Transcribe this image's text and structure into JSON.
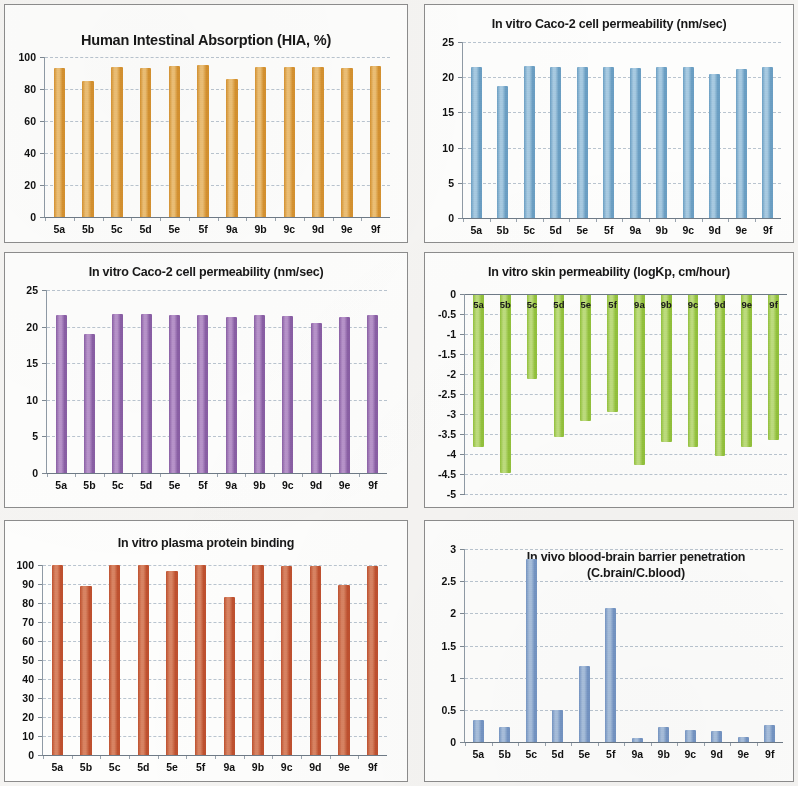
{
  "page": {
    "background": "#f5f4f2",
    "categories": [
      "5a",
      "5b",
      "5c",
      "5d",
      "5e",
      "5f",
      "9a",
      "9b",
      "9c",
      "9d",
      "9e",
      "9f"
    ]
  },
  "panels": [
    {
      "name": "panel-hia",
      "title": "Human Intestinal Absorption (HIA, %)",
      "title_size": "big"
    },
    {
      "name": "panel-caco2-blue",
      "title": "In vitro Caco-2 cell permeability (nm/sec)",
      "title_size": "mid"
    },
    {
      "name": "panel-caco2-purple",
      "title": "In vitro Caco-2 cell permeability (nm/sec)",
      "title_size": "mid"
    },
    {
      "name": "panel-skin",
      "title": "In vitro skin permeability (logKp, cm/hour)",
      "title_size": "mid"
    },
    {
      "name": "panel-ppb",
      "title": "In vitro plasma protein binding",
      "title_size": "mid"
    },
    {
      "name": "panel-bbb",
      "title": "In vivo blood-brain barrier penetration",
      "title_line2": "(C.brain/C.blood)",
      "title_size": "mid"
    }
  ],
  "chart_data": [
    {
      "id": "hia",
      "type": "bar",
      "title": "Human Intestinal Absorption (HIA, %)",
      "xlabel": "",
      "ylabel": "",
      "categories": [
        "5a",
        "5b",
        "5c",
        "5d",
        "5e",
        "5f",
        "9a",
        "9b",
        "9c",
        "9d",
        "9e",
        "9f"
      ],
      "values": [
        93.0,
        85.0,
        94.0,
        93.0,
        94.5,
        95.0,
        86.0,
        94.0,
        94.0,
        94.0,
        93.0,
        94.5
      ],
      "yticks": [
        0,
        20,
        40,
        60,
        80,
        100
      ],
      "ytick_labels": [
        "0",
        "20",
        "40",
        "60",
        "80",
        "100"
      ],
      "ylim": [
        0,
        100
      ],
      "grid": true,
      "legend": "none",
      "bar_color": "#d69230",
      "bar_color_light": "#edc076"
    },
    {
      "id": "caco2_blue",
      "type": "bar",
      "title": "In vitro Caco-2 cell permeability (nm/sec)",
      "xlabel": "",
      "ylabel": "",
      "categories": [
        "5a",
        "5b",
        "5c",
        "5d",
        "5e",
        "5f",
        "9a",
        "9b",
        "9c",
        "9d",
        "9e",
        "9f"
      ],
      "values": [
        21.5,
        18.8,
        21.6,
        21.5,
        21.5,
        21.5,
        21.3,
        21.4,
        21.5,
        20.4,
        21.2,
        21.5
      ],
      "yticks": [
        0,
        5,
        10,
        15,
        20,
        25
      ],
      "ytick_labels": [
        "0",
        "5",
        "10",
        "15",
        "20",
        "25"
      ],
      "ylim": [
        0,
        25
      ],
      "grid": true,
      "legend": "none",
      "bar_color": "#6b9fc4",
      "bar_color_light": "#a8cbe2"
    },
    {
      "id": "caco2_purple",
      "type": "bar",
      "title": "In vitro Caco-2 cell permeability (nm/sec)",
      "xlabel": "",
      "ylabel": "",
      "categories": [
        "5a",
        "5b",
        "5c",
        "5d",
        "5e",
        "5f",
        "9a",
        "9b",
        "9c",
        "9d",
        "9e",
        "9f"
      ],
      "values": [
        21.6,
        19.0,
        21.7,
        21.7,
        21.6,
        21.6,
        21.3,
        21.6,
        21.4,
        20.5,
        21.3,
        21.6
      ],
      "yticks": [
        0,
        5,
        10,
        15,
        20,
        25
      ],
      "ytick_labels": [
        "0",
        "5",
        "10",
        "15",
        "20",
        "25"
      ],
      "ylim": [
        0,
        25
      ],
      "grid": true,
      "legend": "none",
      "bar_color": "#8a5fa5",
      "bar_color_light": "#b894cb"
    },
    {
      "id": "skin",
      "type": "bar",
      "title": "In vitro skin permeability (logKp, cm/hour)",
      "xlabel": "",
      "ylabel": "",
      "categories": [
        "5a",
        "5b",
        "5c",
        "5d",
        "5e",
        "5f",
        "9a",
        "9b",
        "9c",
        "9d",
        "9e",
        "9f"
      ],
      "values": [
        -3.83,
        -4.48,
        -2.13,
        -3.58,
        -3.17,
        -2.95,
        -4.28,
        -3.7,
        -3.83,
        -4.05,
        -3.82,
        -3.66
      ],
      "yticks": [
        0,
        -0.5,
        -1,
        -1.5,
        -2,
        -2.5,
        -3,
        -3.5,
        -4,
        -4.5,
        -5
      ],
      "ytick_labels": [
        "0",
        "-0.5",
        "-1",
        "-1.5",
        "-2",
        "-2.5",
        "-3",
        "-3.5",
        "-4",
        "-4.5",
        "-5"
      ],
      "ylim": [
        -5,
        0
      ],
      "grid": true,
      "legend": "none",
      "category_labels_inside_bars": true,
      "bar_color": "#93c23c",
      "bar_color_light": "#bedd7e"
    },
    {
      "id": "ppb",
      "type": "bar",
      "title": "In vitro plasma protein binding",
      "xlabel": "",
      "ylabel": "",
      "categories": [
        "5a",
        "5b",
        "5c",
        "5d",
        "5e",
        "5f",
        "9a",
        "9b",
        "9c",
        "9d",
        "9e",
        "9f"
      ],
      "values": [
        100.0,
        88.8,
        100.0,
        100.0,
        97.0,
        100.0,
        83.0,
        100.0,
        99.5,
        99.7,
        89.7,
        99.5
      ],
      "yticks": [
        0,
        10,
        20,
        30,
        40,
        50,
        60,
        70,
        80,
        90,
        100
      ],
      "ytick_labels": [
        "0",
        "10",
        "20",
        "30",
        "40",
        "50",
        "60",
        "70",
        "80",
        "90",
        "100"
      ],
      "ylim": [
        0,
        100
      ],
      "grid": true,
      "legend": "none",
      "bar_color": "#bf512f",
      "bar_color_light": "#d98463"
    },
    {
      "id": "bbb",
      "type": "bar",
      "title": "In vivo blood-brain barrier penetration (C.brain/C.blood)",
      "xlabel": "",
      "ylabel": "",
      "categories": [
        "5a",
        "5b",
        "5c",
        "5d",
        "5e",
        "5f",
        "9a",
        "9b",
        "9c",
        "9d",
        "9e",
        "9f"
      ],
      "values": [
        0.34,
        0.23,
        2.84,
        0.49,
        1.18,
        2.08,
        0.06,
        0.23,
        0.19,
        0.17,
        0.08,
        0.27
      ],
      "yticks": [
        0,
        0.5,
        1,
        1.5,
        2,
        2.5,
        3
      ],
      "ytick_labels": [
        "0",
        "0.5",
        "1",
        "1.5",
        "2",
        "2.5",
        "3"
      ],
      "ylim": [
        0,
        3
      ],
      "grid": true,
      "legend": "none",
      "bar_color": "#7595c4",
      "bar_color_light": "#a9c0dd"
    }
  ]
}
